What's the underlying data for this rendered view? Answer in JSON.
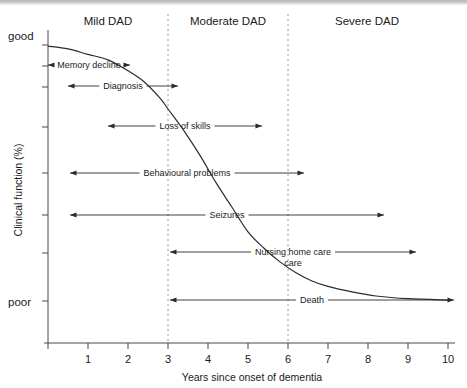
{
  "figure": {
    "name": "dementia-clinical-course-timeline"
  },
  "chart_data": {
    "type": "line",
    "title": "",
    "xlabel": "Years since onset of dementia",
    "ylabel": "Clinical function (%)",
    "xlim": [
      0,
      10
    ],
    "ylim": [
      0,
      100
    ],
    "grid": false,
    "legend": "none",
    "x_ticks": [
      "1",
      "2",
      "3",
      "4",
      "5",
      "6",
      "7",
      "8",
      "9",
      "10"
    ],
    "y_axis_endpoints": {
      "top": "good",
      "bottom": "poor"
    },
    "y_tick_count": 8,
    "series": [
      {
        "name": "Clinical function decline",
        "x": [
          0.0,
          0.5,
          1.0,
          1.5,
          2.0,
          2.4,
          2.8,
          3.0,
          3.4,
          3.8,
          4.2,
          4.6,
          5.0,
          5.4,
          5.8,
          6.2,
          6.6,
          7.0,
          7.6,
          8.2,
          9.0,
          10.0
        ],
        "y": [
          97,
          96,
          94,
          92,
          88,
          84,
          78,
          74,
          66,
          57,
          47,
          38,
          29,
          23,
          18,
          14,
          11,
          9,
          7,
          5.5,
          4.5,
          4
        ]
      }
    ],
    "stage_bands": [
      {
        "label": "Mild DAD",
        "x_start": 0,
        "x_end": 3
      },
      {
        "label": "Moderate DAD",
        "x_start": 3,
        "x_end": 6
      },
      {
        "label": "Severe DAD",
        "x_start": 6,
        "x_end": 10
      }
    ],
    "dividers": [
      3,
      6
    ],
    "annotations": [
      {
        "label": "Memory decline",
        "x_start": 0.0,
        "x_end": 2.05,
        "y_px": 65,
        "start_arrow": true,
        "end_arrow": true
      },
      {
        "label": "Diagnosis",
        "x_start": 0.5,
        "x_end": 3.25,
        "y_px": 86,
        "start_arrow": true,
        "end_arrow": true
      },
      {
        "label": "Loss of skills",
        "x_start": 1.5,
        "x_end": 5.35,
        "y_px": 126,
        "start_arrow": true,
        "end_arrow": true
      },
      {
        "label": "Behavioural problems",
        "x_start": 0.55,
        "x_end": 6.4,
        "y_px": 173,
        "start_arrow": true,
        "end_arrow": true
      },
      {
        "label": "Seizures",
        "x_start": 0.55,
        "x_end": 8.4,
        "y_px": 215,
        "start_arrow": true,
        "end_arrow": true
      },
      {
        "label": "Nursing home care",
        "x_start": 3.05,
        "x_end": 9.2,
        "y_px": 252,
        "start_arrow": true,
        "end_arrow": true,
        "label_line2": "care"
      },
      {
        "label": "Death",
        "x_start": 3.05,
        "x_end": 10.15,
        "y_px": 300,
        "start_arrow": true,
        "end_arrow": true
      }
    ]
  }
}
